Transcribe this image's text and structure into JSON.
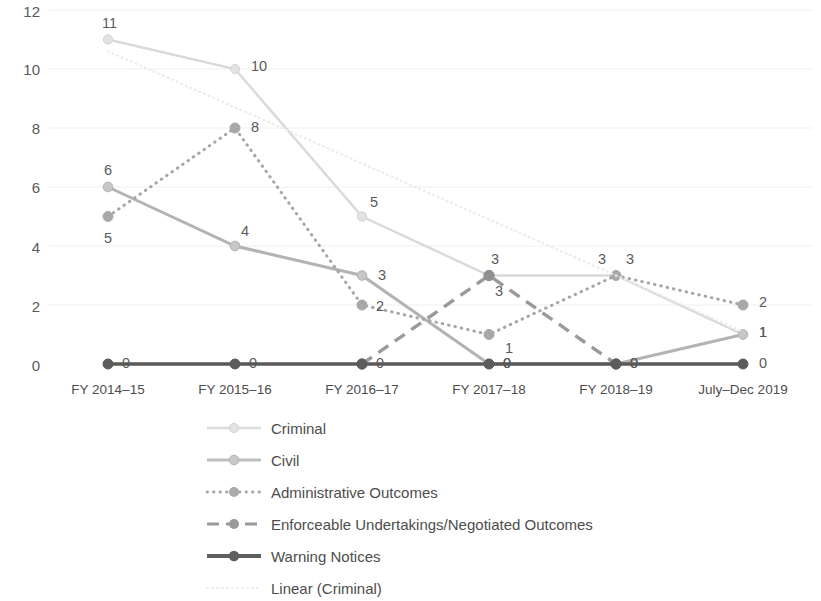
{
  "chart_data": {
    "type": "line",
    "title": "",
    "xlabel": "",
    "ylabel": "",
    "ylim": [
      0,
      12
    ],
    "yticks": [
      "0",
      "2",
      "4",
      "6",
      "8",
      "10",
      "12"
    ],
    "grid": true,
    "legend_position": "bottom-left",
    "categories": [
      "FY 2014–15",
      "FY 2015–16",
      "FY 2016–17",
      "FY 2017–18",
      "FY 2018–19",
      "July–Dec 2019"
    ],
    "series": [
      {
        "name": "Criminal",
        "style": "solid-light",
        "color": "#d9d9d9",
        "values": [
          11,
          10,
          5,
          3,
          3,
          1
        ],
        "labels": [
          "11",
          "10",
          "5",
          "3",
          "3",
          "1"
        ]
      },
      {
        "name": "Civil",
        "style": "solid",
        "color": "#b3b3b3",
        "values": [
          6,
          4,
          3,
          0,
          0,
          1
        ],
        "labels": [
          "6",
          "4",
          "3",
          "0",
          "0",
          "1"
        ]
      },
      {
        "name": "Administrative Outcomes",
        "style": "dotted",
        "color": "#a6a6a6",
        "values": [
          5,
          8,
          2,
          1,
          3,
          2
        ],
        "labels": [
          "5",
          "8",
          "2",
          "1",
          "3",
          "2"
        ]
      },
      {
        "name": "Enforceable Undertakings/Negotiated Outcomes",
        "style": "dashed",
        "color": "#999999",
        "values": [
          null,
          null,
          0,
          3,
          0,
          null
        ],
        "labels": [
          "",
          "",
          "",
          "3",
          "",
          ""
        ]
      },
      {
        "name": "Warning Notices",
        "style": "solid-thick",
        "color": "#595959",
        "values": [
          0,
          0,
          0,
          0,
          0,
          0
        ],
        "labels": [
          "0",
          "0",
          "0",
          "0",
          "0",
          "0"
        ]
      },
      {
        "name": "Linear (Criminal)",
        "style": "dotted-faint",
        "color": "#ececec",
        "values": [
          10.6,
          8.7,
          6.8,
          4.9,
          3.0,
          1.1
        ],
        "labels": [
          "",
          "",
          "",
          "",
          "",
          ""
        ]
      }
    ]
  },
  "legend": {
    "items": [
      {
        "label": "Criminal"
      },
      {
        "label": "Civil"
      },
      {
        "label": "Administrative Outcomes"
      },
      {
        "label": "Enforceable Undertakings/Negotiated Outcomes"
      },
      {
        "label": "Warning Notices"
      },
      {
        "label": "Linear (Criminal)"
      }
    ]
  }
}
